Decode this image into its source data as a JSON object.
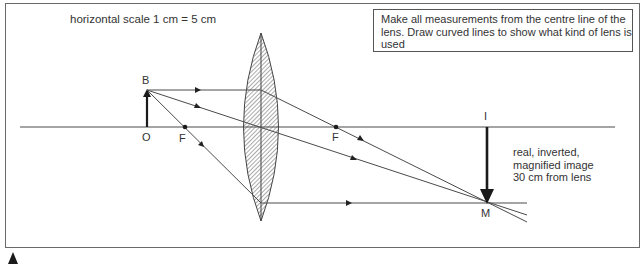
{
  "diagram": {
    "scale_label": "horizontal scale 1 cm = 5 cm",
    "note": {
      "lines": [
        "Make all measurements from the centre line of the",
        "lens. Draw curved lines to show what kind of lens is",
        "used"
      ]
    },
    "labels": {
      "object_top": "B",
      "object_base": "O",
      "focal_left": "F",
      "focal_right": "F",
      "image_base": "I",
      "image_top": "M"
    },
    "image_description": [
      "real, inverted,",
      "magnified image",
      "30 cm from lens"
    ],
    "colors": {
      "line": "#4a4a4a",
      "arrow": "#1a1a1a",
      "lens_hatch": "#555555"
    }
  }
}
